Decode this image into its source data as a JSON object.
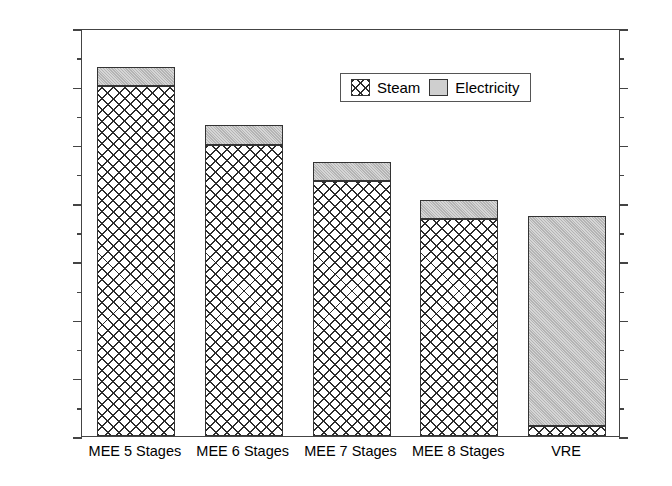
{
  "chart_data": {
    "type": "bar",
    "subtype": "stacked-vertical",
    "title": "",
    "xlabel": "",
    "ylabel": "MJ per MT Water Removed",
    "ylim": [
      0,
      700
    ],
    "ytick_step": 100,
    "yminor_step": 50,
    "grid": false,
    "dual_axis": true,
    "legend_position": "top-center-right",
    "categories": [
      "MEE 5 Stages",
      "MEE 6 Stages",
      "MEE 7 Stages",
      "MEE 8 Stages",
      "VRE"
    ],
    "series": [
      {
        "name": "Steam",
        "values": [
          600,
          500,
          438,
          372,
          17
        ]
      },
      {
        "name": "Electricity",
        "values": [
          33,
          33,
          32,
          33,
          360
        ]
      }
    ],
    "totals": [
      633,
      533,
      470,
      405,
      377
    ],
    "ytick_labels": [
      "0",
      "100",
      "200",
      "300",
      "400",
      "500",
      "600",
      "700"
    ],
    "ytick_values": [
      0,
      100,
      200,
      300,
      400,
      500,
      600,
      700
    ],
    "colors": {
      "steam_fill": "#ffffff",
      "steam_hatch": "#2b2b2b",
      "electricity_fill": "#b4b4b4",
      "axis": "#444444",
      "bar_outline": "#333333"
    }
  },
  "legend": {
    "entries": [
      {
        "label": "Steam",
        "swatch": "crosshatch-swatch"
      },
      {
        "label": "Electricity",
        "swatch": "gray-swatch"
      }
    ]
  },
  "caption": {
    "text": ""
  }
}
